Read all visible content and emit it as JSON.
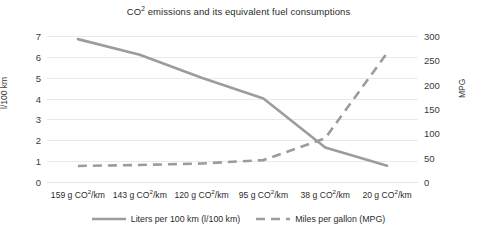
{
  "chart_data": {
    "type": "line",
    "title_prefix": "CO",
    "title_sup": "2",
    "title_rest": " emissions and its equivalent fuel consumptions",
    "xlabel": "",
    "categories": [
      "159 g CO²/km",
      "143 g CO²/km",
      "120 g CO²/km",
      "95 g CO²/km",
      "38 g CO²/km",
      "20 g CO²/km"
    ],
    "category_values": [
      "159",
      "143",
      "120",
      "95",
      "38",
      "20"
    ],
    "category_prefix": "g CO",
    "category_sup": "2",
    "category_suffix": "/km",
    "grid": true,
    "legend_position": "bottom",
    "axes": {
      "left": {
        "label": "l/100 km",
        "min": 0,
        "max": 7,
        "step": 1,
        "ticks": [
          "0",
          "1",
          "2",
          "3",
          "4",
          "5",
          "6",
          "7"
        ]
      },
      "right": {
        "label": "MPG",
        "min": 0,
        "max": 300,
        "step": 50,
        "ticks": [
          "0",
          "50",
          "100",
          "150",
          "200",
          "250",
          "300"
        ]
      }
    },
    "series": [
      {
        "name": "Liters per 100 km (l/100 km)",
        "axis": "left",
        "style": "solid",
        "color": "#9c9c9c",
        "values": [
          6.85,
          6.1,
          5.0,
          4.0,
          1.65,
          0.78
        ]
      },
      {
        "name": "Miles per gallon (MPG)",
        "axis": "right",
        "style": "dashed",
        "color": "#9c9c9c",
        "values": [
          33,
          35,
          38,
          45,
          90,
          265
        ]
      }
    ]
  },
  "legend": {
    "items": [
      {
        "label": "Liters per 100 km (l/100 km)",
        "style": "solid",
        "color": "#9c9c9c"
      },
      {
        "label": "Miles per gallon (MPG)",
        "style": "dashed",
        "color": "#9c9c9c"
      }
    ]
  }
}
